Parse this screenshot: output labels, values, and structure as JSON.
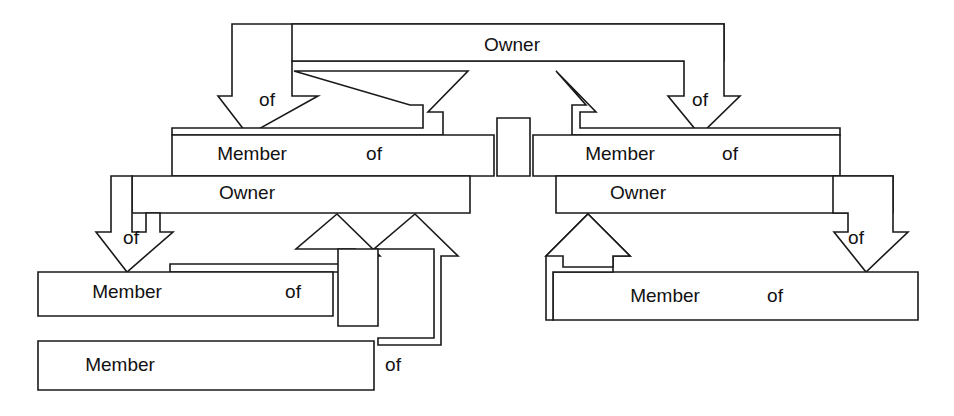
{
  "diagram": {
    "background_color": "#ffffff",
    "line_color": "#1a1a1a",
    "text_color": "#111111",
    "labels": {
      "owner": "Owner",
      "member": "Member",
      "of": "of"
    },
    "nodes": [
      {
        "id": "owner-1",
        "role": "owner",
        "label": "Owner",
        "level": 1,
        "side": "center",
        "x": 512,
        "y": 46
      },
      {
        "id": "member-1",
        "role": "member",
        "label": "Member",
        "of_label": "of",
        "level": 2,
        "side": "left",
        "x": 248,
        "y": 155
      },
      {
        "id": "member-2",
        "role": "member",
        "label": "Member",
        "of_label": "of",
        "level": 2,
        "side": "right",
        "x": 620,
        "y": 155
      },
      {
        "id": "owner-2",
        "role": "owner",
        "label": "Owner",
        "level": 3,
        "side": "left",
        "x": 245,
        "y": 194
      },
      {
        "id": "owner-3",
        "role": "owner",
        "label": "Owner",
        "level": 3,
        "side": "right",
        "x": 638,
        "y": 194
      },
      {
        "id": "member-3",
        "role": "member",
        "label": "Member",
        "of_label": "of",
        "level": 4,
        "side": "left",
        "x": 127,
        "y": 293
      },
      {
        "id": "member-4",
        "role": "member",
        "label": "Member",
        "of_label": "of",
        "level": 4,
        "side": "right",
        "x": 665,
        "y": 297
      },
      {
        "id": "member-5",
        "role": "member",
        "label": "Member",
        "of_label": "of",
        "level": 5,
        "side": "left",
        "x": 120,
        "y": 366
      }
    ],
    "arrows": [
      {
        "id": "arrow-1",
        "direction": "down",
        "label": "of",
        "from": "owner-1",
        "to": "member-1",
        "label_x": 272,
        "label_y": 101
      },
      {
        "id": "arrow-2",
        "direction": "down",
        "label": "of",
        "from": "owner-1",
        "to": "member-2",
        "label_x": 700,
        "label_y": 101
      },
      {
        "id": "arrow-3",
        "direction": "up",
        "label": "",
        "from": "member-1",
        "to": "owner-1",
        "label_x": 0,
        "label_y": 0
      },
      {
        "id": "arrow-4",
        "direction": "up",
        "label": "",
        "from": "member-2",
        "to": "owner-1",
        "label_x": 0,
        "label_y": 0
      },
      {
        "id": "arrow-5",
        "direction": "down",
        "label": "of",
        "from": "owner-2",
        "to": "member-3",
        "label_x": 130,
        "label_y": 239
      },
      {
        "id": "arrow-6",
        "direction": "down",
        "label": "of",
        "from": "owner-3",
        "to": "member-4",
        "label_x": 856,
        "label_y": 239
      },
      {
        "id": "arrow-7",
        "direction": "up",
        "label": "",
        "from": "member-3",
        "to": "owner-2",
        "label_x": 0,
        "label_y": 0
      },
      {
        "id": "arrow-8",
        "direction": "up",
        "label": "",
        "from": "member-5",
        "to": "owner-2",
        "label_x": 0,
        "label_y": 0
      },
      {
        "id": "arrow-9",
        "direction": "up",
        "label": "",
        "from": "member-4",
        "to": "owner-3",
        "label_x": 0,
        "label_y": 0
      }
    ],
    "text_items": [
      {
        "id": "t-owner-1",
        "text": "Owner",
        "x": 512,
        "y": 46,
        "anchor": "middle"
      },
      {
        "id": "t-of-left-1",
        "text": "of",
        "x": 267,
        "y": 101,
        "anchor": "middle"
      },
      {
        "id": "t-of-right-1",
        "text": "of",
        "x": 700,
        "y": 101,
        "anchor": "middle"
      },
      {
        "id": "t-member-1",
        "text": "Member",
        "x": 252,
        "y": 155,
        "anchor": "middle"
      },
      {
        "id": "t-of-m1",
        "text": "of",
        "x": 374,
        "y": 155,
        "anchor": "middle"
      },
      {
        "id": "t-member-2",
        "text": "Member",
        "x": 620,
        "y": 155,
        "anchor": "middle"
      },
      {
        "id": "t-of-m2",
        "text": "of",
        "x": 730,
        "y": 155,
        "anchor": "middle"
      },
      {
        "id": "t-owner-2",
        "text": "Owner",
        "x": 247,
        "y": 194,
        "anchor": "middle"
      },
      {
        "id": "t-owner-3",
        "text": "Owner",
        "x": 638,
        "y": 194,
        "anchor": "middle"
      },
      {
        "id": "t-of-left-2",
        "text": "of",
        "x": 131,
        "y": 239,
        "anchor": "middle"
      },
      {
        "id": "t-of-right-2",
        "text": "of",
        "x": 856,
        "y": 239,
        "anchor": "middle"
      },
      {
        "id": "t-member-3",
        "text": "Member",
        "x": 127,
        "y": 293,
        "anchor": "middle"
      },
      {
        "id": "t-of-m3",
        "text": "of",
        "x": 293,
        "y": 293,
        "anchor": "middle"
      },
      {
        "id": "t-member-4",
        "text": "Member",
        "x": 665,
        "y": 297,
        "anchor": "middle"
      },
      {
        "id": "t-of-m4",
        "text": "of",
        "x": 775,
        "y": 297,
        "anchor": "middle"
      },
      {
        "id": "t-member-5",
        "text": "Member",
        "x": 120,
        "y": 366,
        "anchor": "middle"
      },
      {
        "id": "t-of-m5",
        "text": "of",
        "x": 393,
        "y": 366,
        "anchor": "middle"
      }
    ]
  }
}
